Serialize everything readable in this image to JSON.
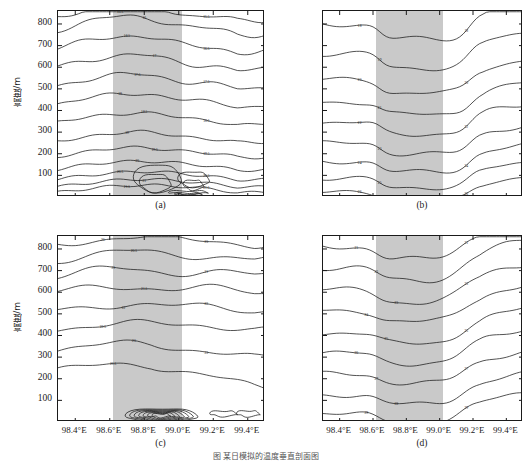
{
  "figure": {
    "caption": "图    某日模拟的温度垂直剖面图",
    "y_axis_label": "高度/m",
    "y_ticks": [
      "800",
      "700",
      "600",
      "500",
      "400",
      "300",
      "200",
      "100"
    ],
    "x_ticks": [
      "98.4°E",
      "98.6°E",
      "98.8°E",
      "99.0°E",
      "99.2°E",
      "99.4°E"
    ],
    "shade_color": "#c9c9c9",
    "line_color": "#1a1a1a"
  },
  "chart_data": {
    "type": "line",
    "title": "图    某日模拟的温度垂直剖面图",
    "xlabel": "",
    "ylabel": "高度/m",
    "xlim": [
      98.3,
      99.5
    ],
    "ylim": [
      0,
      860
    ],
    "grid": false,
    "legend": "none",
    "panels": [
      {
        "id": "a",
        "label": "(a)",
        "show_y_axis": true,
        "show_x_axis": false,
        "shaded_band": [
          98.62,
          99.02
        ],
        "contour_levels": [
          15.5,
          16,
          16.5,
          17,
          17.5,
          18,
          18.5,
          19,
          19.5,
          20,
          20.5,
          21,
          21.5
        ],
        "contour_labels": [
          "15.5",
          "16",
          "16.5",
          "17",
          "17.5",
          "18",
          "18.5",
          "19",
          "19.5",
          "20",
          "20.5",
          "21",
          "21.5"
        ],
        "units": "°C",
        "description": "Temperature cross-section with strong near-surface warm core in shaded valley region"
      },
      {
        "id": "b",
        "label": "(b)",
        "show_y_axis": false,
        "show_x_axis": false,
        "shaded_band": [
          98.62,
          99.02
        ],
        "contour_levels": [
          18,
          19,
          20,
          21,
          22,
          23,
          24,
          25,
          26
        ],
        "contour_labels": [
          "18",
          "19",
          "20",
          "21",
          "22",
          "23",
          "24",
          "25",
          "26"
        ],
        "units": "°C",
        "description": "Temperature cross-section, contours dip sharply over shaded region"
      },
      {
        "id": "c",
        "label": "(c)",
        "show_y_axis": true,
        "show_x_axis": true,
        "shaded_band": [
          98.62,
          99.02
        ],
        "contour_levels": [
          20,
          20.5,
          21,
          21.5,
          22,
          22.5,
          23,
          23.5
        ],
        "contour_labels": [
          "20",
          "20.5",
          "21",
          "21.5",
          "22",
          "22.5",
          "23",
          "23.5"
        ],
        "units": "°C",
        "description": "Temperature cross-section with concentrated near-surface maximum"
      },
      {
        "id": "d",
        "label": "(d)",
        "show_y_axis": false,
        "show_x_axis": true,
        "shaded_band": [
          98.62,
          99.02
        ],
        "contour_levels": [
          21,
          22,
          23,
          24,
          25,
          26,
          27,
          28,
          29
        ],
        "contour_labels": [
          "21",
          "22",
          "23",
          "24",
          "25",
          "26",
          "27",
          "28",
          "29"
        ],
        "units": "°C",
        "description": "Temperature cross-section, contours rise steeply east of shaded region"
      }
    ]
  }
}
